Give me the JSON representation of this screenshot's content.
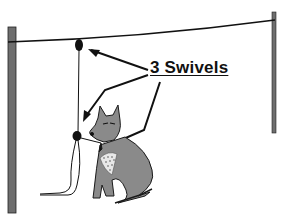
{
  "diagram": {
    "label": "3 Swivels",
    "elements": [
      "left-post",
      "right-post",
      "overhead-cable",
      "trolley-line",
      "swivel-top",
      "swivel-middle",
      "swivel-collar",
      "dog"
    ],
    "colors": {
      "post": "#6e6e6e",
      "line": "#111111",
      "dog": "#8a8a8a",
      "dog-outline": "#1a1a1a",
      "background": "#ffffff"
    }
  }
}
